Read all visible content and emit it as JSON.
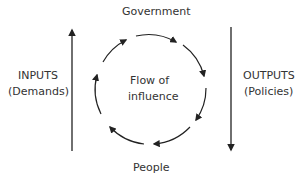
{
  "labels": {
    "top": "Government",
    "bottom": "People",
    "center_line1": "Flow of",
    "center_line2": "influence",
    "left_line1": "INPUTS",
    "left_line2": "(Demands)",
    "right_line1": "OUTPUTS",
    "right_line2": "(Policies)"
  },
  "colors": {
    "stroke": "#222222",
    "text": "#333333"
  }
}
